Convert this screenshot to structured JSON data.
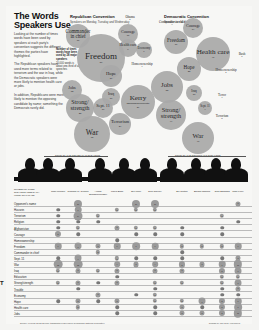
{
  "header": {
    "title": "The Words Speakers Use",
    "intro": [
      "Looking at the number of times words have been used by speakers at each party's convention suggests the different themes the parties have highlighted.",
      "The Republican speakers have used more terms related to terrorism and the war in Iraq, while the Democratic speakers were more likely to mention health care or jobs.",
      "In addition, Republicans were more likely to mention the opposing candidate by name; something the Democrats rarely did."
    ]
  },
  "chart_data": [
    {
      "type": "bubble",
      "title": "Republican Convention",
      "subtitle": "Speakers on Monday, Tuesday and Wednesday",
      "key": "Number of times words have been used by 28 major speakers",
      "key2": "20,000 words is about one-third of all speeches",
      "bubbles": [
        {
          "label": "Commander in chief",
          "value": 11
        },
        {
          "label": "Freedom",
          "value": 56
        },
        {
          "label": "Courage",
          "value": 11
        },
        {
          "label": "Obama",
          "value": 1
        },
        {
          "label": "Economy",
          "value": 9
        },
        {
          "label": "Health care",
          "value": 9
        },
        {
          "label": "Homeownership",
          "value": 4
        },
        {
          "label": "Hope",
          "value": 19
        },
        {
          "label": "Jobs",
          "value": 12
        },
        {
          "label": "Iraq",
          "value": 16
        },
        {
          "label": "Strong/ strength",
          "value": 25
        },
        {
          "label": "Sept. 11",
          "value": 16
        },
        {
          "label": "Kerry",
          "value": 39,
          "note": "(Edwards/Democrats)"
        },
        {
          "label": "Terrorism",
          "value": 24
        },
        {
          "label": "War",
          "value": 65
        }
      ]
    },
    {
      "type": "bubble",
      "title": "Democratic Convention",
      "subtitle": "Speakers on all days",
      "bubbles": [
        {
          "label": "Commander in chief",
          "value": 4
        },
        {
          "label": "Courage",
          "value": 14
        },
        {
          "label": "Freedom",
          "value": 17
        },
        {
          "label": "Health care",
          "value": 47
        },
        {
          "label": "Bush",
          "value": 6
        },
        {
          "label": "Hope",
          "value": 25
        },
        {
          "label": "Homeownership",
          "value": 1
        },
        {
          "label": "Jobs",
          "value": 55
        },
        {
          "label": "Iraq",
          "value": 10
        },
        {
          "label": "Terror",
          "value": 4
        },
        {
          "label": "Strong/ strength",
          "value": 44
        },
        {
          "label": "Sept. 11",
          "value": 4
        },
        {
          "label": "Terrorism",
          "value": 8
        },
        {
          "label": "War",
          "value": 46
        }
      ]
    },
    {
      "type": "table",
      "corner_label": "NUMBER OF TIMES SPEAKERS USED EACH WORD OR PHRASE",
      "groups": [
        {
          "name": "SOME OF THE REPUBLICAN SPEAKERS",
          "speakers": [
            "John McCain",
            "Rudolph W. Giuliani",
            "Arnold Schwarzenegger",
            "Laura Bush",
            "Zell Miller",
            "Dick Cheney"
          ]
        },
        {
          "name": "SOME OF THE DEMOCRATIC SPEAKERS",
          "speakers": [
            "Bill Clinton",
            "Barack Obama",
            "John Edwards",
            "John Kerry"
          ]
        }
      ],
      "rows": [
        {
          "term": "Opponent's name",
          "values": [
            0,
            10,
            0,
            0,
            10,
            10,
            0,
            0,
            0,
            3
          ]
        },
        {
          "term": "Hussein",
          "values": [
            1,
            6,
            0,
            2,
            2,
            2,
            0,
            0,
            0,
            0
          ]
        },
        {
          "term": "Terrorism",
          "values": [
            1,
            14,
            2,
            0,
            0,
            0,
            0,
            0,
            2,
            0
          ]
        },
        {
          "term": "Religion",
          "values": [
            1,
            1,
            1,
            0,
            0,
            0,
            0,
            0,
            0,
            1
          ]
        },
        {
          "term": "Afghanistan",
          "values": [
            1,
            2,
            0,
            3,
            2,
            2,
            1,
            0,
            1,
            0
          ]
        },
        {
          "term": "Courage",
          "values": [
            5,
            1,
            0,
            0,
            1,
            1,
            1,
            0,
            1,
            0
          ]
        },
        {
          "term": "Homeownership",
          "values": [
            0,
            0,
            0,
            1,
            0,
            0,
            0,
            0,
            0,
            0
          ]
        },
        {
          "term": "Freedom",
          "values": [
            6,
            7,
            3,
            6,
            9,
            6,
            2,
            2,
            2,
            6
          ]
        },
        {
          "term": "Commander in chief",
          "values": [
            0,
            0,
            2,
            0,
            0,
            0,
            1,
            0,
            0,
            0
          ]
        },
        {
          "term": "Sept. 11",
          "values": [
            1,
            7,
            0,
            2,
            1,
            1,
            1,
            0,
            1,
            3
          ]
        },
        {
          "term": "War",
          "values": [
            12,
            12,
            0,
            4,
            3,
            4,
            5,
            3,
            6,
            11
          ]
        },
        {
          "term": "Iraq",
          "values": [
            2,
            3,
            2,
            3,
            0,
            3,
            3,
            0,
            5,
            7
          ]
        },
        {
          "term": "Education",
          "values": [
            0,
            0,
            0,
            1,
            0,
            0,
            0,
            0,
            2,
            2
          ]
        },
        {
          "term": "Strong/strength",
          "values": [
            2,
            3,
            1,
            3,
            0,
            2,
            2,
            0,
            2,
            7
          ]
        },
        {
          "term": "Trouble",
          "values": [
            0,
            1,
            0,
            0,
            0,
            1,
            0,
            0,
            1,
            3
          ]
        },
        {
          "term": "Economy",
          "values": [
            0,
            0,
            3,
            0,
            1,
            2,
            0,
            0,
            1,
            1
          ]
        },
        {
          "term": "Hope",
          "values": [
            1,
            3,
            1,
            3,
            0,
            2,
            2,
            7,
            5,
            6
          ]
        },
        {
          "term": "Health care",
          "values": [
            0,
            2,
            0,
            1,
            0,
            1,
            3,
            1,
            5,
            9
          ]
        },
        {
          "term": "Jobs",
          "values": [
            0,
            0,
            0,
            1,
            0,
            1,
            3,
            3,
            5,
            11
          ]
        }
      ]
    }
  ],
  "labels": {
    "rep_convention": "Republican Convention",
    "rep_sub": "Speakers on Monday, Tuesday and Wednesday",
    "dem_convention": "Democratic Convention",
    "dem_sub": "Speakers on all days",
    "key": "Number of times words have been used by 28 major speakers",
    "key2": "20,000 words is about one-third of all speeches",
    "rep_group": "SOME OF THE REPUBLICAN SPEAKERS",
    "dem_group": "SOME OF THE DEMOCRATIC SPEAKERS",
    "corner": "NUMBER OF TIMES SPEAKERS USED EACH WORD OR PHRASE",
    "footer_left": "Source: Federal News Service transcripts of speeches; Republican National Committee",
    "footer_right": "Graphic by The New York Times",
    "edge_mark": "T"
  }
}
